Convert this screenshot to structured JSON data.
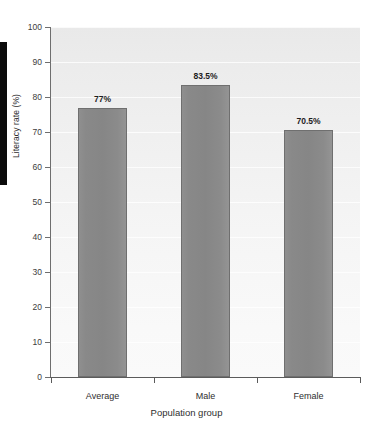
{
  "chart_data": {
    "type": "bar",
    "title": "",
    "xlabel": "Population group",
    "ylabel": "Literacy rate (%)",
    "categories": [
      "Average",
      "Male",
      "Female"
    ],
    "values": [
      77,
      83.5,
      70.5
    ],
    "value_labels": [
      "77%",
      "83.5%",
      "70.5%"
    ],
    "ylim": [
      0,
      100
    ],
    "yticks": [
      0,
      10,
      20,
      30,
      40,
      50,
      60,
      70,
      80,
      90,
      100
    ],
    "ytick_labels": [
      "0",
      "10",
      "20",
      "30",
      "40",
      "50",
      "60",
      "70",
      "80",
      "90",
      "100"
    ],
    "grid": true,
    "legend": "none",
    "bar_color": "#8a8a8a",
    "bar_edge_color": "#6f6f6f",
    "plot_background": "#f2f2f2",
    "axis_color": "#5b5b5b",
    "text_color": "#2e2e2e"
  },
  "decorations": {
    "page_edge_bar_color": "#0b0b0b"
  }
}
